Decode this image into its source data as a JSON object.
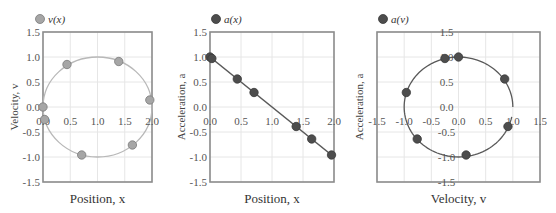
{
  "chart_data": [
    {
      "type": "scatter",
      "title": "",
      "legend": "v(x)",
      "legend_position": "top-left",
      "xlabel": "Position, x",
      "ylabel": "Velocity, v",
      "xlim": [
        0,
        2
      ],
      "ylim": [
        -1.5,
        1.5
      ],
      "xticks": [
        "0.0",
        "0.5",
        "1.0",
        "1.5",
        "2.0"
      ],
      "yticks": [
        "1.5",
        "1.0",
        "0.5",
        "0.0",
        "-0.5",
        "-1.0",
        "-1.5"
      ],
      "grid": true,
      "marker_color": "#a6a6a6",
      "curve_color": "#b8b8b8",
      "curve": "circle centered (1,0) radius 1",
      "points": [
        {
          "x": 0.0,
          "y": 0.0
        },
        {
          "x": 0.03,
          "y": -0.25
        },
        {
          "x": 0.44,
          "y": 0.85
        },
        {
          "x": 0.71,
          "y": -0.96
        },
        {
          "x": 1.39,
          "y": 0.91
        },
        {
          "x": 1.64,
          "y": -0.76
        },
        {
          "x": 1.96,
          "y": 0.14
        }
      ]
    },
    {
      "type": "scatter",
      "title": "",
      "legend": "a(x)",
      "legend_position": "top-left",
      "xlabel": "Position, x",
      "ylabel": "Acceleration, a",
      "xlim": [
        0,
        2
      ],
      "ylim": [
        -1.5,
        1.5
      ],
      "xticks": [
        "0.0",
        "0.5",
        "1.0",
        "1.5",
        "2.0"
      ],
      "yticks": [
        "1.5",
        "1.0",
        "0.5",
        "0.0",
        "-0.5",
        "-1.0",
        "-1.5"
      ],
      "grid": true,
      "marker_color": "#4d4d4d",
      "curve_color": "#595959",
      "curve": "line a = 1 - x",
      "points": [
        {
          "x": 0.0,
          "y": 1.0
        },
        {
          "x": 0.03,
          "y": 0.97
        },
        {
          "x": 0.44,
          "y": 0.56
        },
        {
          "x": 0.71,
          "y": 0.29
        },
        {
          "x": 1.39,
          "y": -0.39
        },
        {
          "x": 1.64,
          "y": -0.64
        },
        {
          "x": 1.96,
          "y": -0.96
        }
      ]
    },
    {
      "type": "scatter",
      "title": "",
      "legend": "a(v)",
      "legend_position": "top-left",
      "xlabel": "Velocity, v",
      "ylabel": "Acceleration, a",
      "xlim": [
        -1.5,
        1.5
      ],
      "ylim": [
        -1.5,
        1.5
      ],
      "xticks": [
        "-1.5",
        "-1.0",
        "-0.5",
        "0.0",
        "0.5",
        "1.0",
        "1.5"
      ],
      "yticks": [
        "1.5",
        "1.0",
        "0.5",
        "0.0",
        "-0.5",
        "-1.0",
        "-1.5"
      ],
      "grid": true,
      "marker_color": "#4d4d4d",
      "curve_color": "#595959",
      "curve": "arc of unit circle centered (0,0) from (1,0) counterclockwise to about (0.97,-0.2)",
      "points": [
        {
          "x": 0.0,
          "y": 1.0
        },
        {
          "x": -0.25,
          "y": 0.97
        },
        {
          "x": 0.85,
          "y": 0.56
        },
        {
          "x": -0.96,
          "y": 0.29
        },
        {
          "x": 0.91,
          "y": -0.39
        },
        {
          "x": -0.76,
          "y": -0.64
        },
        {
          "x": 0.14,
          "y": -0.96
        }
      ]
    }
  ],
  "labels": {
    "c1_legend": "v(x)",
    "c1_xlabel": "Position, x",
    "c1_ylabel": "Velocity, v",
    "c2_legend": "a(x)",
    "c2_xlabel": "Position, x",
    "c2_ylabel": "Acceleration, a",
    "c3_legend": "a(v)",
    "c3_xlabel": "Velocity, v",
    "c3_ylabel": "Acceleration, a"
  }
}
